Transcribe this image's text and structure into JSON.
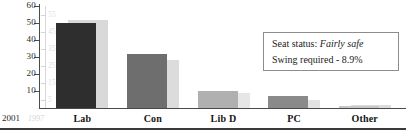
{
  "chart_data": {
    "type": "bar",
    "title": "",
    "xlabel": "",
    "ylabel": "",
    "grid": false,
    "legend_position": "bottom-left",
    "categories": [
      "Lab",
      "Con",
      "Lib D",
      "PC",
      "Other"
    ],
    "series": [
      {
        "name": "2001",
        "values": [
          50,
          32,
          10,
          7,
          1
        ],
        "colors": [
          "#2e2e2e",
          "#6e6e6e",
          "#b0b0b0",
          "#8a8a8a",
          "#c8c8c8"
        ]
      },
      {
        "name": "1997",
        "values": [
          52,
          28,
          9,
          5,
          2
        ],
        "colors": [
          "#d9d9d9",
          "#dcdcdc",
          "#e6e6e6",
          "#e2e2e2",
          "#dcdcdc"
        ]
      }
    ],
    "ylim": [
      0,
      60
    ],
    "yticks": [
      10,
      20,
      30,
      40,
      50,
      60
    ],
    "ytick_labels": [
      "10",
      "20",
      "30",
      "40",
      "50",
      "60"
    ],
    "secondary_yticks": [
      5,
      15,
      25,
      35,
      45,
      55
    ],
    "secondary_ytick_labels": [
      "5",
      "15",
      "25",
      "35",
      "45",
      "55"
    ]
  },
  "axis": {
    "ticks": [
      {
        "value": 60,
        "label": "60"
      },
      {
        "value": 50,
        "label": "50"
      },
      {
        "value": 40,
        "label": "40"
      },
      {
        "value": 30,
        "label": "30"
      },
      {
        "value": 20,
        "label": "20"
      },
      {
        "value": 10,
        "label": "10"
      }
    ],
    "faded_ticks": [
      {
        "value": 55,
        "label": "55"
      },
      {
        "value": 45,
        "label": "45"
      },
      {
        "value": 35,
        "label": "35"
      },
      {
        "value": 25,
        "label": "25"
      },
      {
        "value": 15,
        "label": "15"
      },
      {
        "value": 5,
        "label": "5"
      }
    ]
  },
  "legend": {
    "current_year": "2001",
    "previous_year": "1997"
  },
  "info_box": {
    "seat_status_label": "Seat status:",
    "seat_status_value": "Fairly safe",
    "swing_line": "Swing required - 8.9%"
  }
}
